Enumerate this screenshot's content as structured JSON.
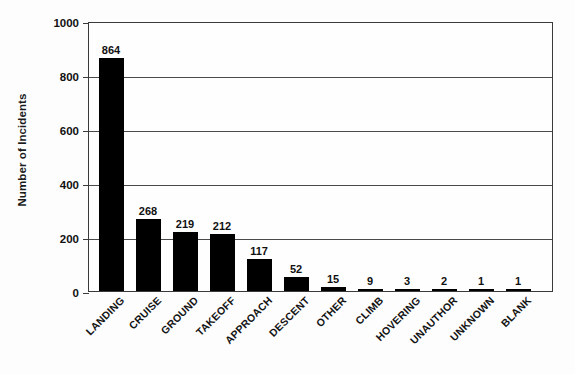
{
  "chart_data": {
    "type": "bar",
    "title": "",
    "xlabel": "",
    "ylabel": "Number of Incidents",
    "categories": [
      "LANDING",
      "CRUISE",
      "GROUND",
      "TAKEOFF",
      "APPROACH",
      "DESCENT",
      "OTHER",
      "CLIMB",
      "HOVERING",
      "UNAUTHOR",
      "UNKNOWN",
      "BLANK"
    ],
    "values": [
      864,
      268,
      219,
      212,
      117,
      52,
      15,
      9,
      3,
      2,
      1,
      1
    ],
    "ylim": [
      0,
      1000
    ],
    "yticks": [
      0,
      200,
      400,
      600,
      800,
      1000
    ],
    "ytick_labels": [
      "0",
      "200",
      "400",
      "600",
      "800",
      "1000"
    ],
    "grid": true,
    "legend": false,
    "bar_color": "#000000",
    "axis_color": "#3a3a3a"
  }
}
